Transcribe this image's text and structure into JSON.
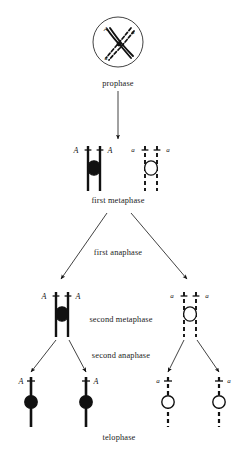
{
  "figure": {
    "width": 237,
    "height": 454,
    "background_color": "#ffffff",
    "ink_color": "#111111"
  },
  "stage_labels": [
    {
      "id": "prophase",
      "text": "prophase",
      "x": 118,
      "y": 83
    },
    {
      "id": "first-metaphase",
      "text": "first metaphase",
      "x": 118,
      "y": 200
    },
    {
      "id": "first-anaphase",
      "text": "first anaphase",
      "x": 118,
      "y": 252
    },
    {
      "id": "second-metaphase",
      "text": "second metaphase",
      "x": 121,
      "y": 319
    },
    {
      "id": "second-anaphase",
      "text": "second anaphase",
      "x": 121,
      "y": 355
    },
    {
      "id": "telophase",
      "text": "telophase",
      "x": 119,
      "y": 437
    }
  ],
  "prophase_cell": {
    "center_x": 118,
    "center_y": 42,
    "radius": 25,
    "labels": [
      {
        "id": "prophase-A-top",
        "text": "A",
        "x": 106,
        "y": 29
      },
      {
        "id": "prophase-a-top",
        "text": "a",
        "x": 133,
        "y": 31
      },
      {
        "id": "prophase-a-bottom",
        "text": "a",
        "x": 106,
        "y": 57
      }
    ]
  },
  "first_metaphase": {
    "solid_pair": {
      "allele": "A",
      "left_label_x": 76,
      "left_label_y": 150,
      "right_label_x": 110,
      "right_label_y": 150,
      "bar_top": 146,
      "bar_bottom": 191,
      "bar1_x": 88,
      "bar2_x": 100,
      "centromere_cx": 94,
      "centromere_cy": 168,
      "centromere_fill": "#111111"
    },
    "dashed_pair": {
      "allele": "a",
      "left_label_x": 133,
      "left_label_y": 150,
      "right_label_x": 168,
      "right_label_y": 150,
      "bar_top": 146,
      "bar_bottom": 191,
      "bar1_x": 145,
      "bar2_x": 157,
      "centromere_cx": 151,
      "centromere_cy": 168,
      "centromere_fill": "#ffffff"
    }
  },
  "second_metaphase": {
    "solid_pair": {
      "allele": "A",
      "left_label_x": 44,
      "left_label_y": 296,
      "right_label_x": 78,
      "right_label_y": 296,
      "bar_top": 292,
      "bar_bottom": 337,
      "bar1_x": 56,
      "bar2_x": 68,
      "centromere_cx": 62,
      "centromere_cy": 314,
      "centromere_fill": "#111111"
    },
    "dashed_pair": {
      "allele": "a",
      "left_label_x": 172,
      "left_label_y": 296,
      "right_label_x": 207,
      "right_label_y": 296,
      "bar_top": 292,
      "bar_bottom": 337,
      "bar1_x": 184,
      "bar2_x": 196,
      "centromere_cx": 190,
      "centromere_cy": 314,
      "centromere_fill": "#ffffff"
    }
  },
  "telophase_cells": [
    {
      "id": "telophase-cell-1",
      "allele": "A",
      "style": "solid",
      "bar_x": 31,
      "bar_top": 377,
      "bar_bottom": 427,
      "centromere_cy": 402,
      "centromere_fill": "#111111",
      "label_x": 21,
      "label_y": 381,
      "label_side": "left"
    },
    {
      "id": "telophase-cell-2",
      "allele": "A",
      "style": "solid",
      "bar_x": 86,
      "bar_top": 377,
      "bar_bottom": 427,
      "centromere_cy": 402,
      "centromere_fill": "#111111",
      "label_x": 96,
      "label_y": 381,
      "label_side": "right"
    },
    {
      "id": "telophase-cell-3",
      "allele": "a",
      "style": "dashed",
      "bar_x": 168,
      "bar_top": 377,
      "bar_bottom": 427,
      "centromere_cy": 402,
      "centromere_fill": "#ffffff",
      "label_x": 158,
      "label_y": 381,
      "label_side": "left"
    },
    {
      "id": "telophase-cell-4",
      "allele": "a",
      "style": "dashed",
      "bar_x": 219,
      "bar_top": 377,
      "bar_bottom": 427,
      "centromere_cy": 402,
      "centromere_fill": "#ffffff",
      "label_x": 229,
      "label_y": 381,
      "label_side": "right"
    }
  ],
  "arrows": [
    {
      "id": "arrow-prophase-to-first-metaphase",
      "x1": 118,
      "y1": 91,
      "x2": 118,
      "y2": 139
    },
    {
      "id": "arrow-first-anaphase-left",
      "x1": 107,
      "y1": 213,
      "x2": 61,
      "y2": 279
    },
    {
      "id": "arrow-first-anaphase-right",
      "x1": 131,
      "y1": 213,
      "x2": 187,
      "y2": 279
    },
    {
      "id": "arrow-second-anaphase-left-1",
      "x1": 56,
      "y1": 340,
      "x2": 31,
      "y2": 372
    },
    {
      "id": "arrow-second-anaphase-left-2",
      "x1": 69,
      "y1": 340,
      "x2": 86,
      "y2": 372
    },
    {
      "id": "arrow-second-anaphase-right-1",
      "x1": 184,
      "y1": 340,
      "x2": 168,
      "y2": 372
    },
    {
      "id": "arrow-second-anaphase-right-2",
      "x1": 197,
      "y1": 340,
      "x2": 219,
      "y2": 372
    }
  ]
}
